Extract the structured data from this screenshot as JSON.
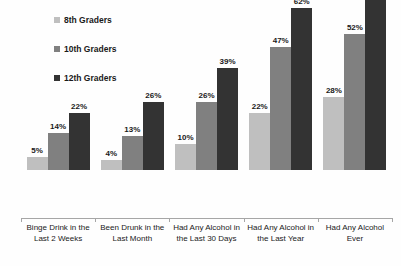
{
  "chart_data": {
    "type": "bar",
    "title": "",
    "subtitle": "",
    "xlabel": "",
    "ylabel": "",
    "ylim": [
      0,
      72
    ],
    "grid": false,
    "legend_position": "top-left",
    "value_suffix": "%",
    "categories": [
      "Binge Drink in the Last 2 Weeks",
      "Been Drunk in the Last Month",
      "Had Any Alcohol in the Last 30 Days",
      "Had Any Alcohol in the Last Year",
      "Had Any Alcohol Ever"
    ],
    "category_lines": [
      [
        "Binge Drink in the",
        "Last 2 Weeks"
      ],
      [
        "Been Drunk in the",
        "Last Month"
      ],
      [
        "Had Any Alcohol in",
        "the Last 30 Days"
      ],
      [
        "Had Any Alcohol in",
        "the Last Year"
      ],
      [
        "Had Any Alcohol",
        "Ever"
      ]
    ],
    "series": [
      {
        "name": "8th Graders",
        "color": "#bfbfbf",
        "values": [
          5,
          4,
          10,
          22,
          28
        ],
        "labels": [
          "5%",
          "4%",
          "10%",
          "22%",
          "28%"
        ]
      },
      {
        "name": "10th Graders",
        "color": "#808080",
        "values": [
          14,
          13,
          26,
          47,
          52
        ],
        "labels": [
          "14%",
          "13%",
          "26%",
          "47%",
          "52%"
        ]
      },
      {
        "name": "12th Graders",
        "color": "#333333",
        "values": [
          22,
          26,
          39,
          62,
          68
        ],
        "labels": [
          "22%",
          "26%",
          "39%",
          "62%",
          "68%"
        ]
      }
    ]
  },
  "legend": {
    "items": [
      {
        "label": "8th Graders",
        "color": "#bfbfbf"
      },
      {
        "label": "10th Graders",
        "color": "#808080"
      },
      {
        "label": "12th Graders",
        "color": "#333333"
      }
    ]
  },
  "axis": {
    "line_color": "#a6a6a6"
  }
}
